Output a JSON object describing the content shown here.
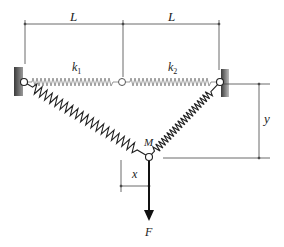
{
  "diagram": {
    "labels": {
      "L_left": "L",
      "L_right": "L",
      "k1": "k",
      "k1_sub": "1",
      "k2": "k",
      "k2_sub": "2",
      "M": "M",
      "x": "x",
      "y": "y",
      "F": "F"
    },
    "points": {
      "left_pivot": [
        24,
        82
      ],
      "middle_pivot": [
        122,
        82
      ],
      "right_pivot": [
        220,
        82
      ],
      "mass_pivot": [
        149,
        157
      ]
    },
    "colors": {
      "line": "#333333",
      "spring_light": "#888888",
      "spring_dark": "#222222",
      "wall": "#555555"
    }
  }
}
